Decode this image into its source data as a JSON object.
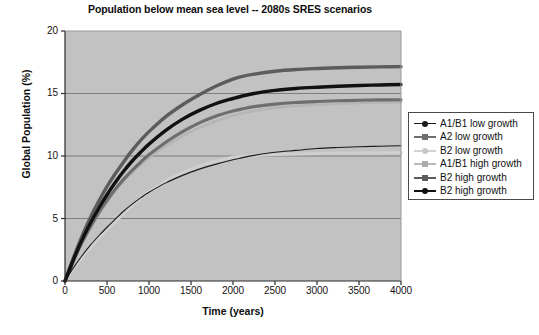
{
  "chart_data": {
    "type": "line",
    "title": "Population below mean sea level -- 2080s SRES scenarios",
    "xlabel": "Time (years)",
    "ylabel": "Global Population (%)",
    "xlim": [
      0,
      4000
    ],
    "ylim": [
      0,
      20
    ],
    "xticks": [
      0,
      500,
      1000,
      1500,
      2000,
      2500,
      3000,
      3500,
      4000
    ],
    "yticks": [
      0,
      5,
      10,
      15,
      20
    ],
    "grid": "horizontal",
    "plot_background": "#c2c2c2",
    "legend_position": "right",
    "x": [
      0,
      100,
      200,
      300,
      400,
      500,
      600,
      700,
      800,
      900,
      1000,
      1200,
      1400,
      1600,
      1800,
      2000,
      2100,
      2250,
      2500,
      2750,
      3000,
      3250,
      3500,
      3750,
      4000
    ],
    "series": [
      {
        "name": "A1/B1 low growth",
        "color": "#1a1a1a",
        "width": 1.1,
        "marker": "dot-dark",
        "values": [
          0.0,
          1.05,
          2.0,
          2.85,
          3.6,
          4.3,
          4.95,
          5.6,
          6.15,
          6.65,
          7.1,
          7.85,
          8.45,
          8.95,
          9.35,
          9.7,
          9.85,
          10.05,
          10.3,
          10.45,
          10.6,
          10.68,
          10.74,
          10.78,
          10.82
        ]
      },
      {
        "name": "A2 low growth",
        "color": "#6e6e6e",
        "width": 3.2,
        "marker": "dot-mid",
        "values": [
          0.0,
          1.6,
          3.05,
          4.3,
          5.45,
          6.45,
          7.35,
          8.15,
          8.85,
          9.5,
          10.1,
          11.1,
          11.95,
          12.65,
          13.2,
          13.6,
          13.75,
          13.95,
          14.15,
          14.28,
          14.36,
          14.42,
          14.46,
          14.49,
          14.5
        ]
      },
      {
        "name": "B2 low growth",
        "color": "#cfcfcf",
        "width": 3.0,
        "marker": "dot-light",
        "values": [
          0.0,
          0.95,
          1.85,
          2.65,
          3.4,
          4.1,
          4.75,
          5.4,
          6.0,
          6.6,
          7.15,
          8.0,
          8.7,
          9.2,
          9.6,
          9.9,
          9.98,
          10.05,
          10.12,
          10.17,
          10.2,
          10.22,
          10.24,
          10.25,
          10.26
        ]
      },
      {
        "name": "A1/B1 high growth",
        "color": "#b5b5b5",
        "width": 2.6,
        "marker": "dash-light",
        "values": [
          0.0,
          1.55,
          2.95,
          4.2,
          5.3,
          6.3,
          7.2,
          8.0,
          8.7,
          9.3,
          9.85,
          10.8,
          11.6,
          12.25,
          12.8,
          13.25,
          13.4,
          13.6,
          13.85,
          14.0,
          14.1,
          14.18,
          14.24,
          14.28,
          14.3
        ]
      },
      {
        "name": "B2 high growth",
        "color": "#5c5c5c",
        "width": 3.4,
        "marker": "dot-mid",
        "values": [
          0.0,
          1.85,
          3.55,
          5.05,
          6.35,
          7.55,
          8.6,
          9.55,
          10.45,
          11.25,
          11.95,
          13.15,
          14.1,
          14.9,
          15.6,
          16.15,
          16.35,
          16.55,
          16.78,
          16.92,
          17.0,
          17.06,
          17.1,
          17.13,
          17.15
        ]
      },
      {
        "name": "B2 high growth",
        "color": "#111111",
        "width": 3.4,
        "marker": "dot-dark",
        "values": [
          0.0,
          1.7,
          3.25,
          4.6,
          5.8,
          6.9,
          7.9,
          8.8,
          9.6,
          10.3,
          10.95,
          12.05,
          12.95,
          13.65,
          14.2,
          14.6,
          14.78,
          15.0,
          15.25,
          15.4,
          15.5,
          15.58,
          15.64,
          15.68,
          15.72
        ]
      }
    ]
  },
  "axes": {
    "yticks_labels": [
      "20",
      "15",
      "10",
      "5",
      "0"
    ],
    "xticks_labels": [
      "0",
      "500",
      "1000",
      "1500",
      "2000",
      "2500",
      "3000",
      "3500",
      "4000"
    ]
  }
}
